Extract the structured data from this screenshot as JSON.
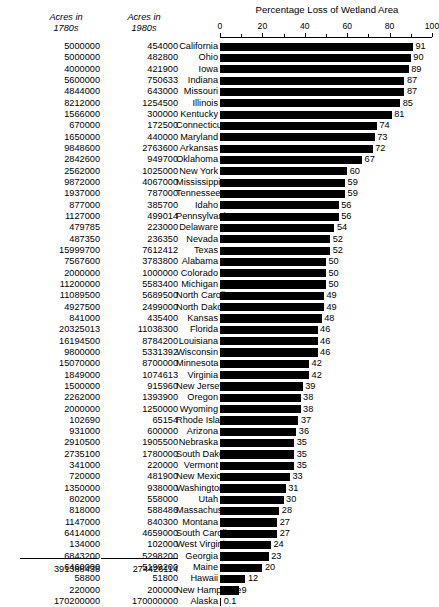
{
  "columns": {
    "acres_1780s_header_line1": "Acres in",
    "acres_1780s_header_line2": "1780s",
    "acres_1980s_header_line1": "Acres in",
    "acres_1980s_header_line2": "1980s"
  },
  "totals": {
    "acres_1780s_total": "391388438",
    "acres_1980s_total": "274426114"
  },
  "chart_data": {
    "type": "bar",
    "title": "Percentage Loss of Wetland Area",
    "xlabel": "",
    "ylabel": "",
    "orientation": "horizontal",
    "xlim": [
      0,
      100
    ],
    "xticks": [
      0,
      20,
      40,
      60,
      80,
      100
    ],
    "xtick_labels": [
      "0",
      "20",
      "40",
      "60",
      "80",
      "100"
    ],
    "grid": false,
    "legend": "none",
    "axis_position": "top",
    "categories": [
      "California",
      "Ohio",
      "Iowa",
      "Indiana",
      "Missouri",
      "Illinois",
      "Kentucky",
      "Connecticut",
      "Maryland",
      "Arkansas",
      "Oklahoma",
      "New York",
      "Mississippi",
      "Tennessee",
      "Idaho",
      "Pennsylvania",
      "Delaware",
      "Nevada",
      "Texas",
      "Alabama",
      "Colorado",
      "Michigan",
      "North Carolina",
      "North Dakota",
      "Kansas",
      "Florida",
      "Louisiana",
      "Wisconsin",
      "Minnesota",
      "Virginia",
      "New Jersey",
      "Oregon",
      "Wyoming",
      "Rhode Island",
      "Arizona",
      "Nebraska",
      "South Dakota",
      "Vermont",
      "New Mexico",
      "Washington",
      "Utah",
      "Massachusetts",
      "Montana",
      "South Carolina",
      "West Virginia",
      "Georgia",
      "Maine",
      "Hawaii",
      "New Hampshire",
      "Alaska"
    ],
    "values": [
      91,
      90,
      89,
      87,
      87,
      85,
      81,
      74,
      73,
      72,
      67,
      60,
      59,
      59,
      56,
      56,
      54,
      52,
      52,
      50,
      50,
      50,
      49,
      49,
      48,
      46,
      46,
      46,
      42,
      42,
      39,
      38,
      38,
      37,
      36,
      35,
      35,
      35,
      33,
      31,
      30,
      28,
      27,
      27,
      24,
      23,
      20,
      12,
      9,
      0.1
    ],
    "value_labels": [
      "91",
      "90",
      "89",
      "87",
      "87",
      "85",
      "81",
      "74",
      "73",
      "72",
      "67",
      "60",
      "59",
      "59",
      "56",
      "56",
      "54",
      "52",
      "52",
      "50",
      "50",
      "50",
      "49",
      "49",
      "48",
      "46",
      "46",
      "46",
      "42",
      "42",
      "39",
      "38",
      "38",
      "37",
      "36",
      "35",
      "35",
      "35",
      "33",
      "31",
      "30",
      "28",
      "27",
      "27",
      "24",
      "23",
      "20",
      "12",
      "9",
      "0.1"
    ],
    "acres_1780s": [
      "5000000",
      "5000000",
      "4000000",
      "5600000",
      "4844000",
      "8212000",
      "1566000",
      "670000",
      "1650000",
      "9848600",
      "2842600",
      "2562000",
      "9872000",
      "1937000",
      "877000",
      "1127000",
      "479785",
      "487350",
      "15999700",
      "7567600",
      "2000000",
      "11200000",
      "11089500",
      "4927500",
      "841000",
      "20325013",
      "16194500",
      "9800000",
      "15070000",
      "1849000",
      "1500000",
      "2262000",
      "2000000",
      "102690",
      "931000",
      "2910500",
      "2735100",
      "341000",
      "720000",
      "1350000",
      "802000",
      "818000",
      "1147000",
      "6414000",
      "134000",
      "6843200",
      "6460000",
      "58800",
      "220000",
      "170200000"
    ],
    "acres_1980s": [
      "454000",
      "482800",
      "421900",
      "750633",
      "643000",
      "1254500",
      "300000",
      "172500",
      "440000",
      "2763600",
      "949700",
      "1025000",
      "4067000",
      "787000",
      "385700",
      "499014",
      "223000",
      "236350",
      "7612412",
      "3783800",
      "1000000",
      "5583400",
      "5689500",
      "2499000",
      "435400",
      "11038300",
      "8784200",
      "5331392",
      "8700000",
      "1074613",
      "915960",
      "1393900",
      "1250000",
      "65154",
      "600000",
      "1905500",
      "1780000",
      "220000",
      "481900",
      "938000",
      "558000",
      "588486",
      "840300",
      "4659000",
      "102000",
      "5298200",
      "5199200",
      "51800",
      "200000",
      "170000000"
    ]
  }
}
